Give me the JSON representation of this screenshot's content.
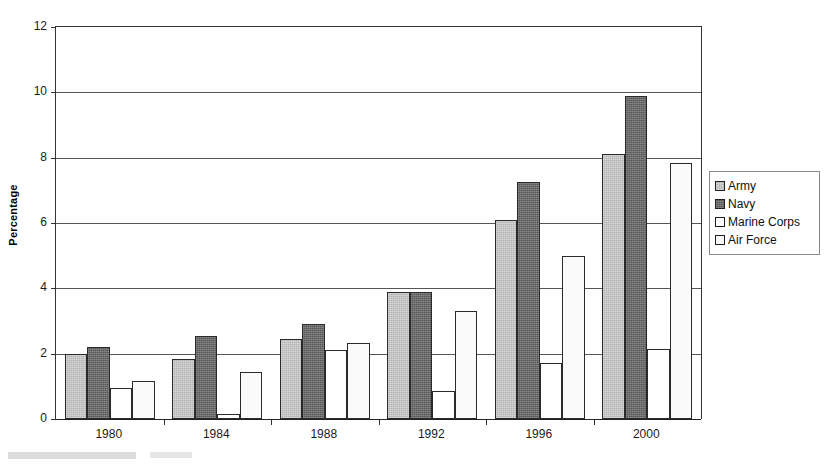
{
  "chart_data": {
    "type": "bar",
    "title": "",
    "subtitle": "",
    "xlabel": "",
    "ylabel": "Percentage",
    "categories": [
      "1980",
      "1984",
      "1988",
      "1992",
      "1996",
      "2000"
    ],
    "series": [
      {
        "name": "Army",
        "color": "#b3b3b3",
        "values": [
          2.0,
          1.85,
          2.45,
          3.9,
          6.1,
          8.1
        ]
      },
      {
        "name": "Navy",
        "color": "#575757",
        "values": [
          2.2,
          2.55,
          2.9,
          3.9,
          7.25,
          9.9
        ]
      },
      {
        "name": "Marine Corps",
        "color": "#ffffff",
        "values": [
          0.95,
          0.15,
          2.1,
          0.85,
          1.7,
          2.15
        ]
      },
      {
        "name": "Air Force",
        "color": "#fafafa",
        "values": [
          1.15,
          1.45,
          2.32,
          3.3,
          5.0,
          7.85
        ]
      }
    ],
    "ylim": [
      0,
      12
    ],
    "ytick_step": 2,
    "yticks": [
      "0",
      "2",
      "4",
      "6",
      "8",
      "10",
      "12"
    ],
    "grid": true,
    "grid_axis": "y",
    "legend_position": "right",
    "legend_entries": [
      "Army",
      "Navy",
      "Marine Corps",
      "Air Force"
    ]
  },
  "axis": {
    "y_title": "Percentage"
  },
  "legend": {
    "items": [
      {
        "label": "Army"
      },
      {
        "label": "Navy"
      },
      {
        "label": "Marine Corps"
      },
      {
        "label": "Air Force"
      }
    ]
  }
}
